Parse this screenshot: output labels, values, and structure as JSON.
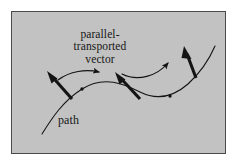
{
  "figure": {
    "name": "parallel-transport-diagram",
    "frame": {
      "background_color": "#c2c2c2",
      "border_color": "#4a4a4a",
      "x": 11,
      "y": 11,
      "width": 215,
      "height": 143
    },
    "ink_color": "#141414",
    "labels": {
      "parallel_transported_vector": "parallel-\ntransported\nvector",
      "path": "path"
    },
    "geometry": {
      "path_curve": "M 42 134 C 52 118 63 101 82 89 C 104 75 124 84 140 92 C 156 100 172 98 188 84 C 200 73 209 60 215 46",
      "vectors": [
        {
          "name": "vector-1",
          "tail_x": 72,
          "tail_y": 99,
          "head_x": 47,
          "head_y": 71
        },
        {
          "name": "vector-2",
          "tail_x": 140,
          "tail_y": 99,
          "head_x": 115,
          "head_y": 72
        },
        {
          "name": "vector-3",
          "tail_x": 196,
          "tail_y": 78,
          "head_x": 184,
          "head_y": 46
        }
      ],
      "transport_arrows": [
        {
          "name": "transport-arrow-1",
          "d": "M 58 80 C 70 71 86 69 99 72"
        },
        {
          "name": "transport-arrow-2",
          "d": "M 122 74 C 138 82 157 76 168 63"
        }
      ],
      "path_points": [
        {
          "name": "path-point-1",
          "x": 82,
          "y": 89
        },
        {
          "name": "path-point-2",
          "x": 170,
          "y": 96
        }
      ]
    }
  }
}
